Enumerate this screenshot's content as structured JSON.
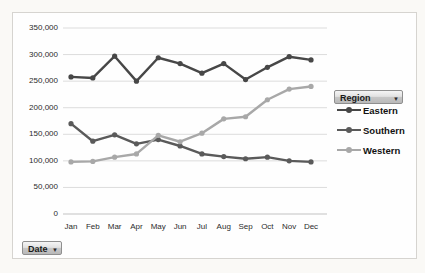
{
  "controls": {
    "region_button": {
      "label": "Region",
      "dropdown_icon": "▼"
    },
    "date_button": {
      "label": "Date",
      "dropdown_icon": "▼"
    }
  },
  "chart_data": {
    "type": "line",
    "title": "",
    "categories": [
      "Jan",
      "Feb",
      "Mar",
      "Apr",
      "May",
      "Jun",
      "Jul",
      "Aug",
      "Sep",
      "Oct",
      "Nov",
      "Dec"
    ],
    "series": [
      {
        "name": "Eastern",
        "color": "#474747",
        "values": [
          258000,
          256000,
          297000,
          250000,
          294000,
          283000,
          265000,
          283000,
          253000,
          276000,
          296000,
          290000
        ]
      },
      {
        "name": "Southern",
        "color": "#5a5a5a",
        "values": [
          170000,
          137000,
          149000,
          132000,
          140000,
          128000,
          113000,
          108000,
          104000,
          107000,
          100000,
          98000
        ]
      },
      {
        "name": "Western",
        "color": "#a8a8a8",
        "values": [
          98000,
          99000,
          107000,
          113000,
          148000,
          136000,
          152000,
          179000,
          183000,
          215000,
          235000,
          240000
        ]
      }
    ],
    "ylim": [
      0,
      350000
    ],
    "ytick_values": [
      0,
      50000,
      100000,
      150000,
      200000,
      250000,
      300000,
      350000
    ],
    "ytick_labels": [
      "0",
      "50,000",
      "100,000",
      "150,000",
      "200,000",
      "250,000",
      "300,000",
      "350,000"
    ],
    "grid": true,
    "legend_position": "right",
    "legend_entries": [
      "Eastern",
      "Southern",
      "Western"
    ]
  },
  "colors": {
    "gridline": "#dcdcdc",
    "axis_line": "#c2c2c2",
    "axis_text": "#2b2b2b",
    "frame_border": "#d6d4d0"
  }
}
